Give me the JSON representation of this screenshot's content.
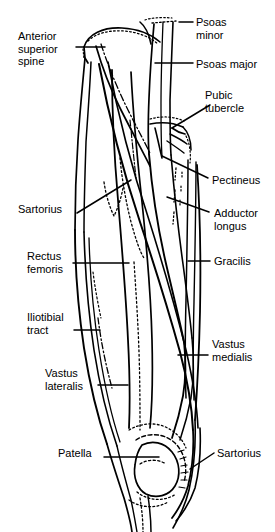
{
  "figure": {
    "background_color": "#ffffff",
    "ink_color": "#000000",
    "width": 275,
    "height": 532
  },
  "labels": [
    {
      "id": "anterior-superior-spine",
      "text": "Anterior\nsuperior\nspine",
      "side": "left",
      "x": 18,
      "y": 30
    },
    {
      "id": "psoas-minor",
      "text": "Psoas\nminor",
      "side": "right",
      "x": 196,
      "y": 16
    },
    {
      "id": "psoas-major",
      "text": "Psoas major",
      "side": "right",
      "x": 196,
      "y": 58
    },
    {
      "id": "pubic-tubercle",
      "text": "Pubic\ntubercle",
      "side": "right",
      "x": 205,
      "y": 89
    },
    {
      "id": "pectineus",
      "text": "Pectineus",
      "side": "right",
      "x": 212,
      "y": 174
    },
    {
      "id": "sartorius-upper",
      "text": "Sartorius",
      "side": "left",
      "x": 18,
      "y": 203
    },
    {
      "id": "adductor-longus",
      "text": "Adductor\nlongus",
      "side": "right",
      "x": 214,
      "y": 207
    },
    {
      "id": "rectus-femoris",
      "text": "Rectus\nfemoris",
      "side": "left",
      "x": 27,
      "y": 250
    },
    {
      "id": "gracilis",
      "text": "Gracilis",
      "side": "right",
      "x": 214,
      "y": 255
    },
    {
      "id": "iliotibial-tract",
      "text": "Iliotibial\ntract",
      "side": "left",
      "x": 27,
      "y": 311
    },
    {
      "id": "vastus-medialis",
      "text": "Vastus\nmedialis",
      "side": "right",
      "x": 212,
      "y": 338
    },
    {
      "id": "vastus-lateralis",
      "text": "Vastus\nlateralis",
      "side": "left",
      "x": 45,
      "y": 367
    },
    {
      "id": "patella",
      "text": "Patella",
      "side": "left",
      "x": 58,
      "y": 447
    },
    {
      "id": "sartorius-lower",
      "text": "Sartorius",
      "side": "right",
      "x": 217,
      "y": 447
    }
  ],
  "leader_lines": [
    {
      "id": "leader-anterior-superior-spine",
      "from": [
        76,
        47
      ],
      "to": [
        105,
        47
      ],
      "style": "straight"
    },
    {
      "id": "leader-psoas-minor",
      "from": [
        179,
        22
      ],
      "to": [
        193,
        22
      ],
      "style": "straight"
    },
    {
      "id": "leader-psoas-major",
      "from": [
        155,
        63
      ],
      "to": [
        193,
        63
      ],
      "style": "straight"
    },
    {
      "id": "leader-pubic-tubercle",
      "from": [
        172,
        128
      ],
      "to": [
        210,
        105
      ],
      "style": "straight"
    },
    {
      "id": "leader-pectineus",
      "from": [
        162,
        156
      ],
      "to": [
        208,
        178
      ],
      "style": "straight"
    },
    {
      "id": "leader-sartorius-upper",
      "from": [
        77,
        213
      ],
      "to": [
        131,
        180
      ],
      "style": "straight"
    },
    {
      "id": "leader-adductor-longus",
      "from": [
        167,
        197
      ],
      "to": [
        209,
        212
      ],
      "style": "straight"
    },
    {
      "id": "leader-rectus-femoris",
      "from": [
        73,
        263
      ],
      "to": [
        129,
        263
      ],
      "style": "straight"
    },
    {
      "id": "leader-gracilis",
      "from": [
        188,
        261
      ],
      "to": [
        210,
        261
      ],
      "style": "straight"
    },
    {
      "id": "leader-iliotibial-tract",
      "from": [
        74,
        330
      ],
      "to": [
        100,
        330
      ],
      "style": "straight"
    },
    {
      "id": "leader-vastus-medialis",
      "from": [
        178,
        355
      ],
      "to": [
        208,
        355
      ],
      "style": "straight"
    },
    {
      "id": "leader-vastus-lateralis",
      "from": [
        98,
        385
      ],
      "to": [
        128,
        385
      ],
      "style": "straight"
    },
    {
      "id": "leader-patella",
      "from": [
        104,
        457
      ],
      "to": [
        159,
        457
      ],
      "style": "straight"
    },
    {
      "id": "leader-sartorius-lower",
      "from": [
        190,
        469
      ],
      "to": [
        214,
        453
      ],
      "style": "straight"
    }
  ]
}
